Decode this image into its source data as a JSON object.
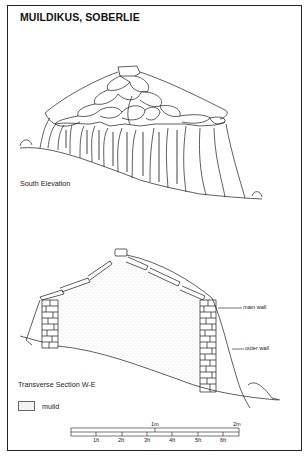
{
  "figure": {
    "title": "MUILDIKUS, SOBERLIE",
    "views": [
      {
        "id": "south-elevation",
        "label": "South Elevation"
      },
      {
        "id": "transverse-section",
        "label": "Transverse Section W-E"
      }
    ],
    "annotations": {
      "main_wall": "main wall",
      "outer_wall": "outer wall"
    },
    "legend": [
      {
        "swatch": "stipple",
        "label": "muild"
      }
    ],
    "scale_bar": {
      "metric_labels": [
        "1m",
        "2m"
      ],
      "imperial_labels": [
        "1ft",
        "2ft",
        "3ft",
        "4ft",
        "5ft",
        "6ft"
      ]
    },
    "caption_cropped": "(caption text cut off at bottom edge)"
  }
}
